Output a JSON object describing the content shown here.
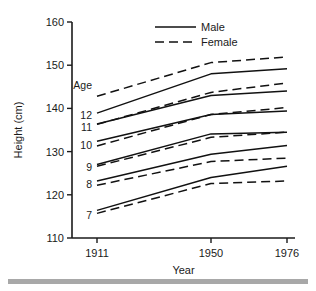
{
  "chart_data": {
    "type": "line",
    "title": "",
    "subtitle": "",
    "xlabel": "Year",
    "ylabel": "Height (cm)",
    "x": [
      1911,
      1950,
      1976
    ],
    "xtick_labels": [
      "1911",
      "1950",
      "1976"
    ],
    "ytick_labels": [
      "110",
      "120",
      "130",
      "140",
      "150",
      "160"
    ],
    "yticks": [
      110,
      120,
      130,
      140,
      150,
      160
    ],
    "ylim": [
      110,
      160
    ],
    "xlim": [
      1911,
      1976
    ],
    "grid": false,
    "legend_position": "top-center",
    "legend": [
      "Male",
      "Female"
    ],
    "group_label": "Age",
    "group_values": [
      "12",
      "11",
      "10",
      "9",
      "8",
      "7"
    ],
    "series": [
      {
        "name": "Age 12 Male",
        "age": 12,
        "sex": "Male",
        "style": "solid",
        "values": [
          138.9,
          148.0,
          149.2
        ]
      },
      {
        "name": "Age 12 Female",
        "age": 12,
        "sex": "Female",
        "style": "dashed",
        "values": [
          142.8,
          150.6,
          151.9
        ]
      },
      {
        "name": "Age 11 Male",
        "age": 11,
        "sex": "Male",
        "style": "solid",
        "values": [
          136.4,
          143.0,
          144.0
        ]
      },
      {
        "name": "Age 11 Female",
        "age": 11,
        "sex": "Female",
        "style": "dashed",
        "values": [
          136.3,
          143.7,
          145.9
        ]
      },
      {
        "name": "Age 10 Male",
        "age": 10,
        "sex": "Male",
        "style": "solid",
        "values": [
          132.4,
          138.6,
          139.4
        ]
      },
      {
        "name": "Age 10 Female",
        "age": 10,
        "sex": "Female",
        "style": "dashed",
        "values": [
          131.3,
          138.6,
          140.2
        ]
      },
      {
        "name": "Age 9 Male",
        "age": 9,
        "sex": "Male",
        "style": "solid",
        "values": [
          127.0,
          134.1,
          134.5
        ]
      },
      {
        "name": "Age 9 Female",
        "age": 9,
        "sex": "Female",
        "style": "dashed",
        "values": [
          126.6,
          133.3,
          134.5
        ]
      },
      {
        "name": "Age 8 Male",
        "age": 8,
        "sex": "Male",
        "style": "solid",
        "values": [
          123.2,
          129.4,
          131.4
        ]
      },
      {
        "name": "Age 8 Female",
        "age": 8,
        "sex": "Female",
        "style": "dashed",
        "values": [
          122.2,
          127.7,
          128.5
        ]
      },
      {
        "name": "Age 7 Male",
        "age": 7,
        "sex": "Male",
        "style": "solid",
        "values": [
          116.4,
          124.0,
          126.6
        ]
      },
      {
        "name": "Age 7 Female",
        "age": 7,
        "sex": "Female",
        "style": "dashed",
        "values": [
          115.7,
          122.6,
          123.2
        ]
      }
    ]
  }
}
